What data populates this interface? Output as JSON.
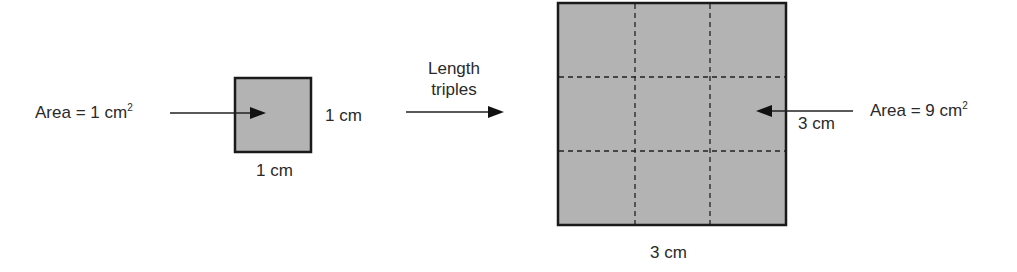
{
  "diagram": {
    "left_label": {
      "prefix": "Area = 1 cm",
      "sup": "2"
    },
    "small_square": {
      "side_label": "1 cm",
      "bottom_label": "1 cm",
      "fill": "#b3b3b3",
      "border": "#1a1a1a"
    },
    "transform_label": {
      "line1": "Length",
      "line2": "triples"
    },
    "large_square": {
      "inner_label": "3 cm",
      "bottom_label": "3 cm",
      "fill": "#b3b3b3",
      "border": "#1a1a1a",
      "grid": "3x3 dashed"
    },
    "right_label": {
      "prefix": "Area = 9 cm",
      "sup": "2"
    }
  }
}
